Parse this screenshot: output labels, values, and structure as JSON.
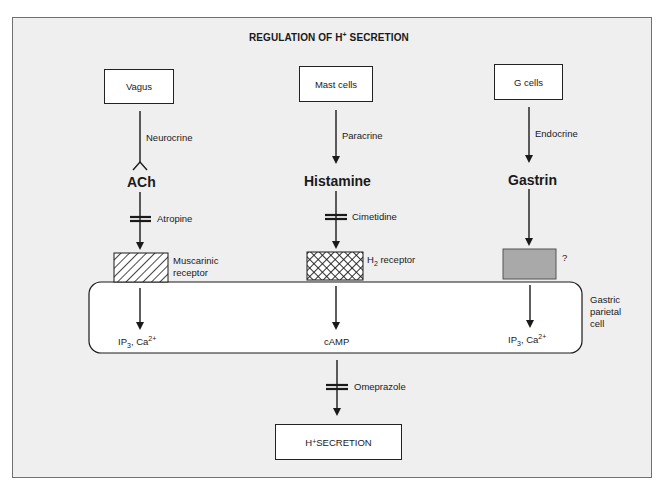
{
  "title": {
    "prefix": "REGULATION OF H",
    "sup": "+",
    "suffix": " SECRETION"
  },
  "sources": [
    {
      "label": "Vagus",
      "route": "Neurocrine",
      "messenger": "ACh",
      "blocker": "Atropine",
      "receptor_line1": "Muscarinic",
      "receptor_line2": "receptor",
      "second_messenger_main": "IP",
      "second_messenger_sub": "3",
      "second_messenger_mid": ", Ca",
      "second_messenger_sup": "2+"
    },
    {
      "label": "Mast cells",
      "route": "Paracrine",
      "messenger": "Histamine",
      "blocker": "Cimetidine",
      "receptor_main": "H",
      "receptor_sub": "2",
      "receptor_rest": " receptor",
      "second_messenger": "cAMP"
    },
    {
      "label": "G cells",
      "route": "Endocrine",
      "messenger": "Gastrin",
      "receptor_unknown": "?",
      "second_messenger_main": "IP",
      "second_messenger_sub": "3",
      "second_messenger_mid": ", Ca",
      "second_messenger_sup": "2+"
    }
  ],
  "cell": {
    "line1": "Gastric",
    "line2": "parietal",
    "line3": "cell"
  },
  "final_blocker": "Omeprazole",
  "output": {
    "prefix": "H",
    "sup": "+",
    "suffix": " SECRETION"
  },
  "colors": {
    "background": "#efefef",
    "box_fill": "#ffffff",
    "stroke": "#1a1a1a",
    "gastrin_receptor_fill": "#a9a9a9"
  }
}
